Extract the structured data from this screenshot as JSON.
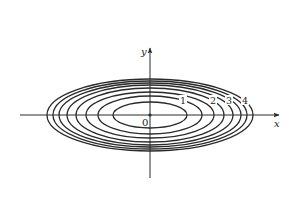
{
  "figure": {
    "type": "level-curves",
    "colors": {
      "background": "#ffffff",
      "stroke": "#2a2a2a",
      "text": "#222222"
    },
    "axes": {
      "x_label": "x",
      "y_label": "y",
      "origin_label": "0"
    },
    "contour_labels": [
      "1",
      "2",
      "3",
      "4"
    ],
    "ellipse_count": 8
  }
}
